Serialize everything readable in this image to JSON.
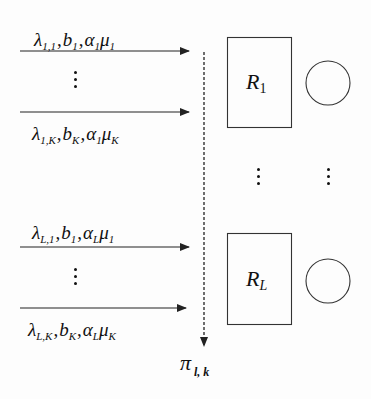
{
  "diagram": {
    "flows": [
      {
        "id": "flow-1-1",
        "position": "above",
        "lambda": {
          "base": "λ",
          "sub": "1,1"
        },
        "b": {
          "base": "b",
          "sub": "1"
        },
        "alpha": {
          "base": "α",
          "sub": "1"
        },
        "mu": {
          "base": "μ",
          "sub": "1"
        }
      },
      {
        "id": "flow-1-K",
        "position": "below",
        "lambda": {
          "base": "λ",
          "sub": "1,K"
        },
        "b": {
          "base": "b",
          "sub": "K"
        },
        "alpha": {
          "base": "α",
          "sub": "1"
        },
        "mu": {
          "base": "μ",
          "sub": "K"
        }
      },
      {
        "id": "flow-L-1",
        "position": "above",
        "lambda": {
          "base": "λ",
          "sub": "L,1"
        },
        "b": {
          "base": "b",
          "sub": "1"
        },
        "alpha": {
          "base": "α",
          "sub": "L"
        },
        "mu": {
          "base": "μ",
          "sub": "1"
        }
      },
      {
        "id": "flow-L-K",
        "position": "below",
        "lambda": {
          "base": "λ",
          "sub": "L,K"
        },
        "b": {
          "base": "b",
          "sub": "K"
        },
        "alpha": {
          "base": "α",
          "sub": "L"
        },
        "mu": {
          "base": "μ",
          "sub": "K"
        }
      }
    ],
    "separator": ",",
    "resources": [
      {
        "base": "R",
        "sub": "1"
      },
      {
        "base": "R",
        "sub": "L"
      }
    ],
    "policy_label": {
      "base": "π",
      "sub": "l, k"
    },
    "colors": {
      "stroke": "#222222",
      "background": "#fdfdfd"
    }
  }
}
